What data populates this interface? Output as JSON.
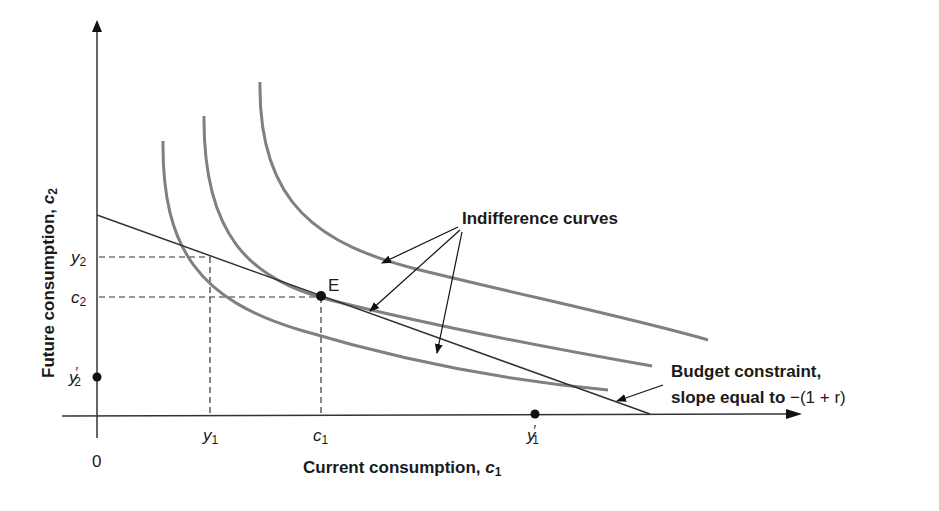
{
  "diagram": {
    "type": "intertemporal-choice",
    "colors": {
      "axis": "#333333",
      "curve": "#808080",
      "budget": "#333333",
      "text": "#1a1a1a"
    },
    "axes": {
      "x_label": "Current consumption, ",
      "x_label_var": "c",
      "x_label_sub": "1",
      "y_label": "Future consumption, ",
      "y_label_var": "c",
      "y_label_sub": "2",
      "origin": "0"
    },
    "x_ticks": [
      {
        "var": "y",
        "sub": "1",
        "prime": ""
      },
      {
        "var": "c",
        "sub": "1",
        "prime": ""
      },
      {
        "var": "y",
        "sub": "1",
        "prime": "′"
      }
    ],
    "y_ticks": [
      {
        "var": "y",
        "sub": "2",
        "prime": ""
      },
      {
        "var": "c",
        "sub": "2",
        "prime": ""
      },
      {
        "var": "y",
        "sub": "2",
        "prime": "′"
      }
    ],
    "point_label": "E",
    "annotations": {
      "indifference": "Indifference curves",
      "budget_line1": "Budget constraint,",
      "budget_line2": "slope equal to ",
      "budget_slope": "−(1 + r)"
    }
  }
}
